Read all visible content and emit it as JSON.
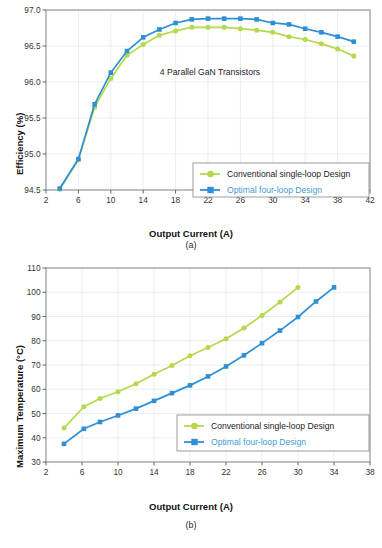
{
  "figures": [
    {
      "id": "a",
      "caption": "(a)",
      "annotation": "4 Parallel GaN Transistors",
      "legend": {
        "items": [
          {
            "label": "Conventional single-loop Design",
            "color": "#b5d94c",
            "marker": "circle"
          },
          {
            "label": "Optimal four-loop Design",
            "color": "#2f8fd4",
            "marker": "square"
          }
        ]
      },
      "chart_data": {
        "type": "line",
        "title": "",
        "subtitle": "4 Parallel GaN Transistors",
        "xlabel": "Output Current (A)",
        "ylabel": "Efficiency (%)",
        "xlim": [
          2,
          42
        ],
        "ylim": [
          94.5,
          97.0
        ],
        "xticks": [
          2,
          6,
          10,
          14,
          18,
          22,
          26,
          30,
          34,
          38,
          42
        ],
        "yticks": [
          94.5,
          95.0,
          95.5,
          96.0,
          96.5,
          97.0
        ],
        "grid": true,
        "legend_position": "lower-right",
        "series": [
          {
            "name": "Conventional single-loop Design",
            "color": "#b5d94c",
            "marker": "circle",
            "x": [
              3.7,
              6,
              8,
              10,
              12,
              14,
              16,
              18,
              20,
              22,
              24,
              26,
              28,
              30,
              32,
              34,
              36,
              38,
              40
            ],
            "y": [
              94.51,
              94.92,
              95.65,
              96.05,
              96.37,
              96.52,
              96.65,
              96.71,
              96.76,
              96.76,
              96.76,
              96.74,
              96.72,
              96.69,
              96.63,
              96.59,
              96.53,
              96.46,
              96.36
            ]
          },
          {
            "name": "Optimal four-loop Design",
            "color": "#2f8fd4",
            "marker": "square",
            "x": [
              3.7,
              6,
              8,
              10,
              12,
              14,
              16,
              18,
              20,
              22,
              24,
              26,
              28,
              30,
              32,
              34,
              36,
              38,
              40
            ],
            "y": [
              94.52,
              94.93,
              95.69,
              96.13,
              96.43,
              96.62,
              96.73,
              96.82,
              96.87,
              96.88,
              96.88,
              96.88,
              96.87,
              96.82,
              96.8,
              96.74,
              96.69,
              96.63,
              96.56
            ]
          }
        ]
      }
    },
    {
      "id": "b",
      "caption": "(b)",
      "annotation": "",
      "legend": {
        "items": [
          {
            "label": "Conventional single-loop Design",
            "color": "#b5d94c",
            "marker": "circle"
          },
          {
            "label": "Optimal four-loop Design",
            "color": "#2f8fd4",
            "marker": "square"
          }
        ]
      },
      "chart_data": {
        "type": "line",
        "title": "",
        "xlabel": "Output Current (A)",
        "ylabel": "Maximum Temperature (°C)",
        "xlim": [
          2,
          38
        ],
        "ylim": [
          30,
          110
        ],
        "xticks": [
          2,
          6,
          10,
          14,
          18,
          22,
          26,
          30,
          34,
          38
        ],
        "yticks": [
          30,
          40,
          50,
          60,
          70,
          80,
          90,
          100,
          110
        ],
        "grid": true,
        "legend_position": "lower-right",
        "series": [
          {
            "name": "Conventional single-loop Design",
            "color": "#b5d94c",
            "marker": "circle",
            "x": [
              4,
              6.2,
              8,
              10,
              12,
              14,
              16,
              18,
              20,
              22,
              24,
              26,
              28,
              30
            ],
            "y": [
              44.0,
              52.8,
              56.2,
              59.0,
              62.3,
              66.2,
              69.8,
              73.8,
              77.2,
              80.8,
              85.3,
              90.4,
              96.0,
              102.0
            ]
          },
          {
            "name": "Optimal four-loop Design",
            "color": "#2f8fd4",
            "marker": "square",
            "x": [
              4,
              6.2,
              8,
              10,
              12,
              14,
              16,
              18,
              20,
              22,
              24,
              26,
              28,
              30,
              32,
              34
            ],
            "y": [
              37.5,
              43.7,
              46.5,
              49.2,
              52.0,
              55.2,
              58.4,
              61.6,
              65.3,
              69.4,
              74.0,
              79.0,
              84.2,
              89.8,
              96.2,
              102.0
            ]
          }
        ]
      }
    }
  ]
}
